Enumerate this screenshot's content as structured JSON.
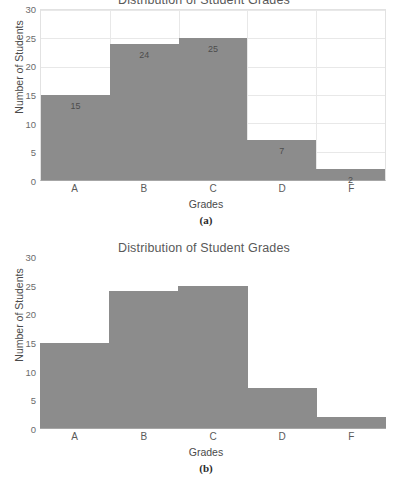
{
  "figure": {
    "panels": [
      {
        "caption": "(a)",
        "title": "Distribution of Student Grades",
        "gridlines": true,
        "data_labels": true
      },
      {
        "caption": "(b)",
        "title": "Distribution of Student Grades",
        "gridlines": false,
        "data_labels": false
      }
    ]
  },
  "axis": {
    "yticks": [
      "0",
      "5",
      "10",
      "15",
      "20",
      "25",
      "30"
    ],
    "ylabel": "Number of Students",
    "xlabel": "Grades",
    "xticks": [
      "A",
      "B",
      "C",
      "D",
      "F"
    ]
  },
  "colors": {
    "bar": "#8c8c8c",
    "grid": "#e8e8e8",
    "axis": "#a6a6a6",
    "text": "#4a4a4a",
    "background": "#ffffff"
  },
  "chart_data": [
    {
      "type": "bar",
      "title": "Distribution of Student Grades",
      "categories": [
        "A",
        "B",
        "C",
        "D",
        "F"
      ],
      "values": [
        15,
        24,
        25,
        7,
        2
      ],
      "labels": [
        "15",
        "24",
        "25",
        "7",
        "2"
      ],
      "xlabel": "Grades",
      "ylabel": "Number of Students",
      "ylim": [
        0,
        30
      ],
      "ytick_step": 5,
      "grid": true,
      "legend": "none",
      "annotation": "(a)"
    },
    {
      "type": "bar",
      "title": "Distribution of Student Grades",
      "categories": [
        "A",
        "B",
        "C",
        "D",
        "F"
      ],
      "values": [
        15,
        24,
        25,
        7,
        2
      ],
      "labels": [],
      "xlabel": "Grades",
      "ylabel": "Number of Students",
      "ylim": [
        0,
        30
      ],
      "ytick_step": 5,
      "grid": false,
      "legend": "none",
      "annotation": "(b)"
    }
  ]
}
